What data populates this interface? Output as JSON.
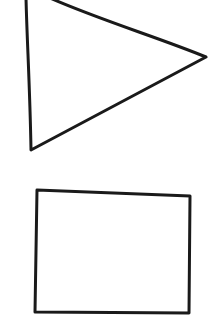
{
  "canvas": {
    "width": 220,
    "height": 336,
    "background": "#ffffff"
  },
  "style": {
    "stroke_color": "#1a1a1a",
    "stroke_width": 3
  },
  "shapes": [
    {
      "type": "triangle",
      "label": "",
      "orientation": "pointing-right",
      "points": [
        [
          26,
          -2
        ],
        [
          50,
          -2
        ],
        [
          206,
          57
        ],
        [
          31,
          150
        ]
      ],
      "path": "M26,-2 C27,40 30,90 31,150 L206,57 C160,38 100,20 50,-2"
    },
    {
      "type": "rectangle",
      "label": "",
      "points": [
        [
          37,
          190
        ],
        [
          190,
          196
        ],
        [
          189,
          313
        ],
        [
          35,
          312
        ]
      ],
      "path": "M37,190 L190,196 L189,313 L35,312 Z"
    }
  ]
}
